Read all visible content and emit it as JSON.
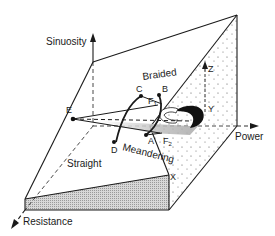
{
  "diagram": {
    "axes": {
      "vertical": "Sinuosity",
      "horizontal": "Power",
      "depth": "Resistance"
    },
    "regions": {
      "top": "Braided",
      "middle": "Meandering",
      "lower": "Straight"
    },
    "points": {
      "A": "A",
      "B": "B",
      "C": "C",
      "D": "D",
      "E": "E",
      "X": "X",
      "Y": "Y",
      "Z": "Z"
    },
    "thresholds": {
      "F1": {
        "letter": "F",
        "sub": "1"
      },
      "F2": {
        "letter": "F",
        "sub": "2"
      }
    },
    "colors": {
      "line": "#1a1a1a",
      "shade": "#c8c8c8",
      "stipple": "#555555",
      "background": "#ffffff"
    }
  }
}
